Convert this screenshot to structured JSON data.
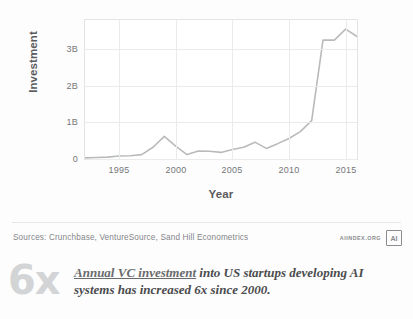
{
  "figure": {
    "sources_label": "Sources: Crunchbase, VentureSource, Sand Hill Econometrics",
    "brand_text": "AIINDEX.ORG",
    "brand_mark_glyph": "AI",
    "stat_value": "6x",
    "caption_link": "Annual VC investment",
    "caption_rest": " into US startups developing AI systems has increased 6x since 2000.",
    "accent_color": "#b9babc",
    "grid_color": "#eaebec",
    "text_color": "#58595b"
  },
  "chart_data": {
    "type": "line",
    "title": "",
    "subtitle": "",
    "xlabel": "Year",
    "ylabel": "Investment",
    "xlim": [
      1992,
      2016
    ],
    "ylim": [
      0,
      3.8
    ],
    "grid": true,
    "legend": "none",
    "y_tick_labels": [
      "0",
      "1B",
      "2B",
      "3B"
    ],
    "y_tick_values": [
      0,
      1,
      2,
      3
    ],
    "x_tick_labels": [
      "1995",
      "2000",
      "2005",
      "2010",
      "2015"
    ],
    "x_tick_values": [
      1995,
      2000,
      2005,
      2010,
      2015
    ],
    "series": [
      {
        "name": "Annual VC investment",
        "color": "#b9babc",
        "x": [
          1992,
          1993,
          1994,
          1995,
          1996,
          1997,
          1998,
          1999,
          2000,
          2001,
          2002,
          2003,
          2004,
          2005,
          2006,
          2007,
          2008,
          2009,
          2010,
          2011,
          2012,
          2013,
          2014,
          2015,
          2016
        ],
        "values": [
          0.03,
          0.04,
          0.05,
          0.08,
          0.09,
          0.12,
          0.32,
          0.62,
          0.35,
          0.12,
          0.22,
          0.21,
          0.18,
          0.26,
          0.32,
          0.46,
          0.29,
          0.42,
          0.56,
          0.75,
          1.05,
          3.25,
          3.25,
          3.55,
          3.35
        ]
      }
    ]
  }
}
